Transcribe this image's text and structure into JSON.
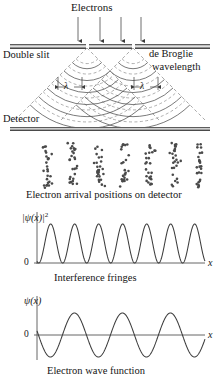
{
  "figure": {
    "title_labels": {
      "electrons": "Electrons",
      "double_slit": "Double slit",
      "de_broglie_line1": "de Broglie",
      "de_broglie_line2": "wavelength",
      "detector": "Detector",
      "arrival_caption": "Electron arrival positions on detector",
      "fringes_caption": "Interference fringes",
      "wavefunction_caption": "Electron wave function",
      "lambda_left": "λ",
      "lambda_right": "λ"
    },
    "colors": {
      "ink": "#141414",
      "curve": "#3d3d3d",
      "dashed": "#6e6e6e",
      "barrier_dark": "#6f6f6f",
      "barrier_light": "#efefef",
      "dot": "#4a4a4a",
      "axis": "#555555"
    },
    "incident_arrows": {
      "count": 4,
      "x_positions": [
        78,
        100,
        121,
        141
      ],
      "y_start": 18,
      "y_end": 43
    },
    "barrier": {
      "y": 44,
      "height": 5,
      "segments": [
        {
          "x": 10,
          "width": 76
        },
        {
          "x": 89,
          "width": 43
        },
        {
          "x": 135,
          "width": 75
        }
      ],
      "slits": [
        {
          "x": 86,
          "width": 3
        },
        {
          "x": 132,
          "width": 3
        }
      ]
    },
    "detector_bar": {
      "x": 10,
      "y": 127,
      "width": 200,
      "height": 4
    }
  },
  "chart_data": [
    {
      "type": "scatter",
      "title": "Electron arrival positions on detector",
      "xlabel": "",
      "ylabel": "",
      "grid": false,
      "legend": null,
      "description": "Seven vertical bands of randomly scattered dots on the detector plane",
      "cluster_count": 7,
      "cluster_centers_x": [
        47,
        73,
        99,
        124,
        150,
        175,
        199
      ],
      "cluster_band_y": [
        143,
        188
      ],
      "dots_per_cluster": [
        26,
        27,
        26,
        27,
        26,
        26,
        25
      ],
      "dot_radius": 1.3
    },
    {
      "type": "line",
      "title": "Interference fringes",
      "xlabel": "x",
      "ylabel": "|ψ(x)|²",
      "y_origin_label": "0",
      "grid": false,
      "legend": null,
      "axis": {
        "x0": 37,
        "x1": 205,
        "y_baseline": 263,
        "y_peak": 224
      },
      "peaks": 7,
      "function": "sin^2",
      "xlim": [
        0,
        7
      ],
      "ylim": [
        0,
        1
      ],
      "x": [
        0,
        0.25,
        0.5,
        0.75,
        1,
        1.25,
        1.5,
        1.75,
        2,
        2.25,
        2.5,
        2.75,
        3,
        3.25,
        3.5,
        3.75,
        4,
        4.25,
        4.5,
        4.75,
        5,
        5.25,
        5.5,
        5.75,
        6,
        6.25,
        6.5,
        6.75,
        7
      ],
      "values": [
        0,
        0.5,
        1,
        0.5,
        0,
        0.5,
        1,
        0.5,
        0,
        0.5,
        1,
        0.5,
        0,
        0.5,
        1,
        0.5,
        0,
        0.5,
        1,
        0.5,
        0,
        0.5,
        1,
        0.5,
        0,
        0.5,
        1,
        0.5,
        0
      ]
    },
    {
      "type": "line",
      "title": "Electron wave function",
      "xlabel": "x",
      "ylabel": "ψ(x)",
      "y_origin_label": "0",
      "grid": false,
      "legend": null,
      "axis": {
        "x0": 37,
        "x1": 205,
        "y_baseline": 335,
        "y_peak": 313,
        "y_trough": 357
      },
      "cycles": 3.5,
      "function": "sin",
      "xlim": [
        0,
        3.5
      ],
      "ylim": [
        -1,
        1
      ],
      "x": [
        0,
        0.25,
        0.5,
        0.75,
        1,
        1.25,
        1.5,
        1.75,
        2,
        2.25,
        2.5,
        2.75,
        3,
        3.25,
        3.5
      ],
      "values": [
        0,
        1,
        0,
        -1,
        0,
        1,
        0,
        -1,
        0,
        1,
        0,
        -1,
        0,
        1,
        0
      ]
    }
  ],
  "wavefronts": {
    "description": "Two sets of circular dashed and solid wavefronts spreading from each slit",
    "sources_x": [
      87,
      133
    ],
    "source_y": 47,
    "radii": [
      14,
      26,
      38,
      50,
      62,
      74
    ]
  }
}
